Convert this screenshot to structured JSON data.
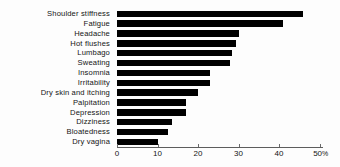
{
  "chart_data": {
    "type": "bar",
    "orientation": "horizontal",
    "title": "",
    "xlabel": "",
    "ylabel": "",
    "xlim": [
      0,
      50
    ],
    "grid": false,
    "legend": null,
    "unit": "%",
    "tick_labels": [
      "0",
      "10",
      "20",
      "30",
      "40",
      "50%"
    ],
    "tick_values": [
      0,
      10,
      20,
      30,
      40,
      50
    ],
    "bar_color": "#000000",
    "categories": [
      "Shoulder  stiffness",
      "Fatigue",
      "Headache",
      "Hot  flushes",
      "Lumbago",
      "Sweating",
      "Insomnia",
      "Irritability",
      "Dry  skin  and  itching",
      "Palpitation",
      "Depression",
      "Dizziness",
      "Bloatedness",
      "Dry  vagina"
    ],
    "values": [
      46,
      41,
      30,
      29.5,
      28.5,
      28,
      23,
      23,
      20,
      17,
      17,
      13.5,
      12.5,
      10
    ]
  }
}
